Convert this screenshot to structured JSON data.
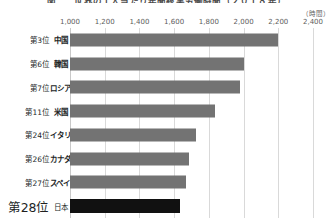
{
  "chart": {
    "title": "図二　世界の１人当たり年間総実労働時間（２０１８年）",
    "unit_label": "（時間）"
  },
  "axis": {
    "ticks": [
      "1,000",
      "1,200",
      "1,400",
      "1,600",
      "1,800",
      "2,000",
      "2,200",
      "2,400"
    ]
  },
  "rows": [
    {
      "rank": "第3位",
      "country": "中国",
      "value": 2200
    },
    {
      "rank": "第6位",
      "country": "韓国",
      "value": 2005
    },
    {
      "rank": "第7位",
      "country": "ロシア",
      "value": 1980
    },
    {
      "rank": "第11位",
      "country": "米国",
      "value": 1835
    },
    {
      "rank": "第24位",
      "country": "イタリア",
      "value": 1725
    },
    {
      "rank": "第26位",
      "country": "カナダ",
      "value": 1685
    },
    {
      "rank": "第27位",
      "country": "スペイン",
      "value": 1668
    },
    {
      "rank": "第28位",
      "country": "日本",
      "value": 1633
    }
  ],
  "colors": {
    "bar": "#737373",
    "bar_highlight": "#111111",
    "gridline": "#d9d9d9",
    "text": "#221f1f"
  },
  "chart_data": {
    "type": "bar",
    "orientation": "horizontal",
    "title": "図二　世界の１人当たり年間総実労働時間（２０１８年）",
    "xlabel": "（時間）",
    "ylabel": "",
    "categories": [
      "中国",
      "韓国",
      "ロシア",
      "米国",
      "イタリア",
      "カナダ",
      "スペイン",
      "日本"
    ],
    "category_ranks": [
      "第3位",
      "第6位",
      "第7位",
      "第11位",
      "第24位",
      "第26位",
      "第27位",
      "第28位"
    ],
    "values": [
      2200,
      2005,
      1980,
      1835,
      1725,
      1685,
      1668,
      1633
    ],
    "xlim": [
      1000,
      2400
    ],
    "xticks": [
      1000,
      1200,
      1400,
      1600,
      1800,
      2000,
      2200,
      2400
    ],
    "xtick_labels": [
      "1,000",
      "1,200",
      "1,400",
      "1,600",
      "1,800",
      "2,000",
      "2,200",
      "2,400"
    ],
    "grid": true,
    "grid_axis": "x",
    "legend": false,
    "highlighted_category": "日本"
  }
}
